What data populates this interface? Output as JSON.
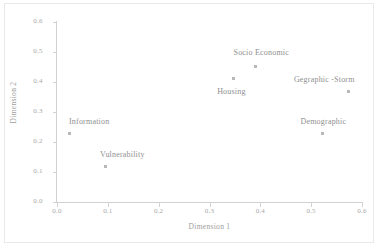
{
  "chart_data": {
    "type": "scatter",
    "title": "",
    "xlabel": "Dimension 1",
    "ylabel": "Dimension 2",
    "xlim": [
      0.0,
      0.6
    ],
    "ylim": [
      0.0,
      0.6
    ],
    "xticks": [
      "0.0",
      "0.1",
      "0.2",
      "0.3",
      "0.4",
      "0.5",
      "0.6"
    ],
    "yticks": [
      "0.0",
      "0.1",
      "0.2",
      "0.3",
      "0.4",
      "0.5",
      "0.6"
    ],
    "grid": false,
    "legend": "none",
    "marker_color": "#b9b9b9",
    "label_color": "#8f8f8f",
    "axis_color": "#d2d2d2",
    "points": [
      {
        "label": "Information",
        "x": 0.024,
        "y": 0.23,
        "label_dx": 20,
        "label_dy": -12
      },
      {
        "label": "Vulnerability",
        "x": 0.095,
        "y": 0.12,
        "label_dx": 17,
        "label_dy": -12
      },
      {
        "label": "Housing",
        "x": 0.347,
        "y": 0.413,
        "label_dx": -2,
        "label_dy": 13
      },
      {
        "label": "Socio Economic",
        "x": 0.39,
        "y": 0.453,
        "label_dx": 6,
        "label_dy": -14
      },
      {
        "label": "Gegraphic -Storm",
        "x": 0.573,
        "y": 0.367,
        "label_dx": -24,
        "label_dy": -13
      },
      {
        "label": "Demographic",
        "x": 0.522,
        "y": 0.227,
        "label_dx": 1,
        "label_dy": -13
      }
    ]
  }
}
